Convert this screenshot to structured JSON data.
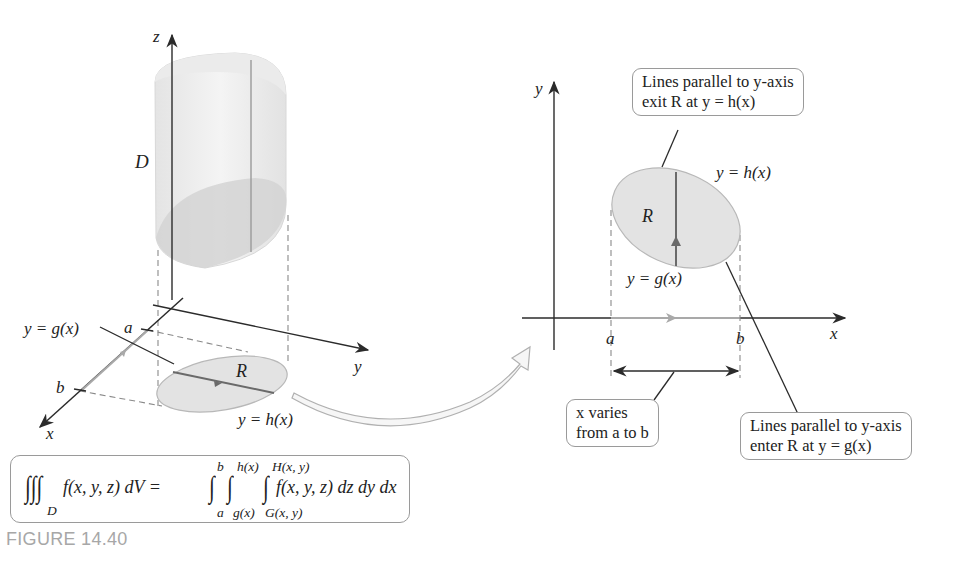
{
  "figure": {
    "caption": "FIGURE 14.40",
    "colors": {
      "axis": "#2b2b2b",
      "region_fill": "#e6e6e6",
      "region_stroke": "#b8b8b8",
      "solid_fill": "#efefef",
      "guide_arrow": "#a9a9a9",
      "callout_border": "#9a9a9a",
      "caption": "#a7a7a7"
    }
  },
  "left_panel": {
    "axis_labels": {
      "z": "z",
      "y": "y",
      "x": "x"
    },
    "solid_label": "D",
    "region_label": "R",
    "tick_a": "a",
    "tick_b": "b",
    "lower_curve_label": "y = g(x)",
    "upper_curve_label": "y = h(x)"
  },
  "formula": {
    "lhs_integrand": "f(x, y, z) dV =",
    "lhs_region": "D",
    "outer_lower": "a",
    "outer_upper": "b",
    "middle_lower": "g(x)",
    "middle_upper": "h(x)",
    "inner_lower": "G(x, y)",
    "inner_upper": "H(x, y)",
    "rhs_integrand": "f(x, y, z) dz dy dx"
  },
  "right_panel": {
    "axis_labels": {
      "y": "y",
      "x": "x"
    },
    "region_label": "R",
    "tick_a": "a",
    "tick_b": "b",
    "upper_curve_label": "y = h(x)",
    "lower_curve_label": "y = g(x)",
    "callouts": {
      "exit": {
        "line1": "Lines parallel to y-axis",
        "line2": "exit R at y = h(x)"
      },
      "enter": {
        "line1": "Lines parallel to y-axis",
        "line2": "enter R at y = g(x)"
      },
      "x_range": {
        "line1": "x varies",
        "line2": "from a to b"
      }
    }
  }
}
